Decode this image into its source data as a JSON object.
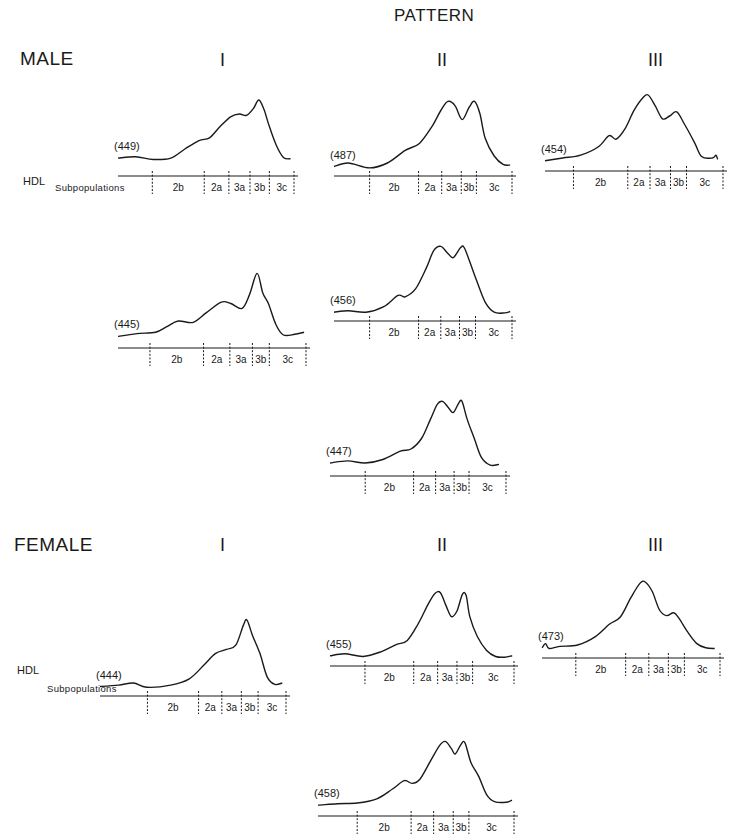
{
  "figure": {
    "header": "PATTERN",
    "groups": [
      {
        "id": "male",
        "label": "MALE"
      },
      {
        "id": "female",
        "label": "FEMALE"
      }
    ],
    "columns": [
      "I",
      "II",
      "III"
    ],
    "axis_label_line1": "HDL",
    "axis_label_line2": "Subpopulations",
    "subpopulation_labels": [
      "2b",
      "2a",
      "3a",
      "3b",
      "3c"
    ],
    "line_color": "#1a1a1a",
    "background": "#ffffff"
  },
  "chart_data": {
    "type": "line",
    "title": "PATTERN",
    "xlabel": "HDL Subpopulations",
    "x_regions": [
      "2b",
      "2a",
      "3a",
      "3b",
      "3c"
    ],
    "panels": [
      {
        "group": "MALE",
        "pattern": "I",
        "id": "(449)",
        "peaks": [
          "3b"
        ],
        "shoulder": [
          "3a"
        ]
      },
      {
        "group": "MALE",
        "pattern": "II",
        "id": "(487)",
        "peaks": [
          "3a",
          "3b"
        ]
      },
      {
        "group": "MALE",
        "pattern": "III",
        "id": "(454)",
        "peaks": [
          "2a"
        ],
        "shoulder": [
          "3b"
        ]
      },
      {
        "group": "MALE",
        "pattern": "I",
        "id": "(445)",
        "peaks": [
          "3b"
        ],
        "shoulder": [
          "3a",
          "2b"
        ]
      },
      {
        "group": "MALE",
        "pattern": "II",
        "id": "(456)",
        "peaks": [
          "3a",
          "3b"
        ]
      },
      {
        "group": "MALE",
        "pattern": "II",
        "id": "(447)",
        "peaks": [
          "3a",
          "3b"
        ]
      },
      {
        "group": "FEMALE",
        "pattern": "I",
        "id": "(444)",
        "peaks": [
          "3b"
        ],
        "shoulder": [
          "3a"
        ]
      },
      {
        "group": "FEMALE",
        "pattern": "II",
        "id": "(455)",
        "peaks": [
          "3a",
          "3b"
        ]
      },
      {
        "group": "FEMALE",
        "pattern": "III",
        "id": "(473)",
        "peaks": [
          "2a"
        ],
        "shoulder": [
          "3b"
        ]
      },
      {
        "group": "FEMALE",
        "pattern": "II",
        "id": "(458)",
        "peaks": [
          "3a",
          "3b"
        ],
        "shoulder": [
          "2a"
        ]
      }
    ]
  },
  "panels": [
    {
      "name": "male-I-449",
      "id_label": "(449)",
      "x": 118,
      "y": 90,
      "w": 176,
      "ticks": [
        0.0,
        0.195,
        0.49,
        0.63,
        0.75,
        0.86,
        1.0
      ],
      "curve": [
        [
          0,
          0.83
        ],
        [
          0.1,
          0.81
        ],
        [
          0.2,
          0.85
        ],
        [
          0.3,
          0.83
        ],
        [
          0.38,
          0.7
        ],
        [
          0.46,
          0.58
        ],
        [
          0.52,
          0.54
        ],
        [
          0.58,
          0.38
        ],
        [
          0.64,
          0.24
        ],
        [
          0.69,
          0.2
        ],
        [
          0.73,
          0.22
        ],
        [
          0.77,
          0.12
        ],
        [
          0.8,
          0.0
        ],
        [
          0.83,
          0.14
        ],
        [
          0.86,
          0.38
        ],
        [
          0.9,
          0.65
        ],
        [
          0.94,
          0.82
        ],
        [
          0.98,
          0.84
        ]
      ]
    },
    {
      "name": "male-II-487",
      "id_label": "(487)",
      "x": 334,
      "y": 90,
      "w": 178,
      "ticks": [
        0.0,
        0.2,
        0.475,
        0.605,
        0.715,
        0.8,
        1.0
      ],
      "curve": [
        [
          0,
          0.95
        ],
        [
          0.08,
          0.9
        ],
        [
          0.2,
          0.97
        ],
        [
          0.3,
          0.9
        ],
        [
          0.4,
          0.72
        ],
        [
          0.48,
          0.62
        ],
        [
          0.55,
          0.38
        ],
        [
          0.6,
          0.15
        ],
        [
          0.64,
          0.02
        ],
        [
          0.68,
          0.08
        ],
        [
          0.72,
          0.28
        ],
        [
          0.76,
          0.1
        ],
        [
          0.79,
          0.02
        ],
        [
          0.82,
          0.2
        ],
        [
          0.85,
          0.55
        ],
        [
          0.9,
          0.8
        ],
        [
          0.95,
          0.92
        ],
        [
          0.99,
          0.93
        ]
      ]
    },
    {
      "name": "male-III-454",
      "id_label": "(454)",
      "x": 545,
      "y": 85,
      "w": 178,
      "ticks": [
        0.0,
        0.16,
        0.465,
        0.59,
        0.705,
        0.795,
        1.0
      ],
      "curve": [
        [
          0,
          0.94
        ],
        [
          0.1,
          0.9
        ],
        [
          0.2,
          0.86
        ],
        [
          0.3,
          0.74
        ],
        [
          0.36,
          0.58
        ],
        [
          0.4,
          0.63
        ],
        [
          0.45,
          0.48
        ],
        [
          0.5,
          0.22
        ],
        [
          0.55,
          0.04
        ],
        [
          0.58,
          0.0
        ],
        [
          0.62,
          0.16
        ],
        [
          0.66,
          0.34
        ],
        [
          0.7,
          0.3
        ],
        [
          0.74,
          0.24
        ],
        [
          0.78,
          0.4
        ],
        [
          0.84,
          0.68
        ],
        [
          0.88,
          0.88
        ],
        [
          0.94,
          0.9
        ],
        [
          0.96,
          0.86
        ],
        [
          0.97,
          0.92
        ]
      ]
    },
    {
      "name": "male-I-445",
      "id_label": "(445)",
      "x": 118,
      "y": 262,
      "w": 188,
      "ticks": [
        0.0,
        0.17,
        0.455,
        0.595,
        0.715,
        0.805,
        1.0
      ],
      "curve": [
        [
          0,
          0.92
        ],
        [
          0.1,
          0.88
        ],
        [
          0.2,
          0.86
        ],
        [
          0.26,
          0.78
        ],
        [
          0.32,
          0.7
        ],
        [
          0.4,
          0.72
        ],
        [
          0.47,
          0.58
        ],
        [
          0.55,
          0.43
        ],
        [
          0.6,
          0.45
        ],
        [
          0.66,
          0.52
        ],
        [
          0.7,
          0.32
        ],
        [
          0.74,
          0.02
        ],
        [
          0.77,
          0.3
        ],
        [
          0.8,
          0.45
        ],
        [
          0.84,
          0.75
        ],
        [
          0.88,
          0.9
        ],
        [
          0.94,
          0.89
        ],
        [
          0.99,
          0.86
        ]
      ]
    },
    {
      "name": "male-II-456",
      "id_label": "(456)",
      "x": 334,
      "y": 235,
      "w": 178,
      "ticks": [
        0.0,
        0.2,
        0.475,
        0.6,
        0.705,
        0.795,
        1.0
      ],
      "curve": [
        [
          0,
          0.96
        ],
        [
          0.08,
          0.94
        ],
        [
          0.18,
          0.96
        ],
        [
          0.28,
          0.88
        ],
        [
          0.36,
          0.72
        ],
        [
          0.4,
          0.74
        ],
        [
          0.46,
          0.62
        ],
        [
          0.52,
          0.32
        ],
        [
          0.56,
          0.08
        ],
        [
          0.6,
          0.02
        ],
        [
          0.64,
          0.12
        ],
        [
          0.67,
          0.18
        ],
        [
          0.71,
          0.04
        ],
        [
          0.73,
          0.03
        ],
        [
          0.76,
          0.22
        ],
        [
          0.8,
          0.5
        ],
        [
          0.85,
          0.82
        ],
        [
          0.9,
          0.96
        ],
        [
          0.96,
          0.97
        ],
        [
          0.99,
          0.95
        ]
      ]
    },
    {
      "name": "male-II-447",
      "id_label": "(447)",
      "x": 330,
      "y": 390,
      "w": 176,
      "ticks": [
        0.0,
        0.2,
        0.475,
        0.6,
        0.705,
        0.79,
        1.0
      ],
      "curve": [
        [
          0,
          0.9
        ],
        [
          0.1,
          0.87
        ],
        [
          0.2,
          0.9
        ],
        [
          0.3,
          0.85
        ],
        [
          0.4,
          0.73
        ],
        [
          0.46,
          0.7
        ],
        [
          0.52,
          0.55
        ],
        [
          0.57,
          0.28
        ],
        [
          0.61,
          0.06
        ],
        [
          0.64,
          0.02
        ],
        [
          0.67,
          0.1
        ],
        [
          0.7,
          0.18
        ],
        [
          0.73,
          0.05
        ],
        [
          0.75,
          0.02
        ],
        [
          0.78,
          0.28
        ],
        [
          0.82,
          0.55
        ],
        [
          0.86,
          0.82
        ],
        [
          0.91,
          0.93
        ],
        [
          0.96,
          0.92
        ]
      ]
    },
    {
      "name": "female-I-444",
      "id_label": "(444)",
      "x": 100,
      "y": 610,
      "w": 186,
      "ticks": [
        0.0,
        0.255,
        0.53,
        0.655,
        0.76,
        0.85,
        1.0
      ],
      "curve": [
        [
          0,
          0.95
        ],
        [
          0.1,
          0.93
        ],
        [
          0.18,
          0.9
        ],
        [
          0.25,
          0.96
        ],
        [
          0.38,
          0.93
        ],
        [
          0.48,
          0.84
        ],
        [
          0.56,
          0.64
        ],
        [
          0.62,
          0.48
        ],
        [
          0.68,
          0.42
        ],
        [
          0.73,
          0.36
        ],
        [
          0.77,
          0.08
        ],
        [
          0.79,
          0.0
        ],
        [
          0.82,
          0.22
        ],
        [
          0.86,
          0.48
        ],
        [
          0.9,
          0.82
        ],
        [
          0.94,
          0.92
        ],
        [
          0.98,
          0.9
        ]
      ]
    },
    {
      "name": "female-II-455",
      "id_label": "(455)",
      "x": 330,
      "y": 580,
      "w": 184,
      "ticks": [
        0.0,
        0.19,
        0.455,
        0.585,
        0.69,
        0.775,
        1.0
      ],
      "curve": [
        [
          0,
          0.94
        ],
        [
          0.08,
          0.91
        ],
        [
          0.18,
          0.95
        ],
        [
          0.28,
          0.88
        ],
        [
          0.36,
          0.78
        ],
        [
          0.42,
          0.72
        ],
        [
          0.48,
          0.48
        ],
        [
          0.53,
          0.22
        ],
        [
          0.57,
          0.05
        ],
        [
          0.6,
          0.04
        ],
        [
          0.63,
          0.22
        ],
        [
          0.66,
          0.38
        ],
        [
          0.69,
          0.3
        ],
        [
          0.72,
          0.06
        ],
        [
          0.74,
          0.08
        ],
        [
          0.76,
          0.38
        ],
        [
          0.8,
          0.66
        ],
        [
          0.85,
          0.86
        ],
        [
          0.9,
          0.95
        ],
        [
          0.95,
          0.96
        ],
        [
          0.99,
          0.94
        ]
      ]
    },
    {
      "name": "female-III-473",
      "id_label": "(473)",
      "x": 542,
      "y": 572,
      "w": 178,
      "ticks": [
        0.0,
        0.19,
        0.47,
        0.6,
        0.71,
        0.8,
        1.0
      ],
      "curve": [
        [
          0,
          0.94
        ],
        [
          0.02,
          0.88
        ],
        [
          0.04,
          0.95
        ],
        [
          0.1,
          0.92
        ],
        [
          0.2,
          0.9
        ],
        [
          0.3,
          0.78
        ],
        [
          0.38,
          0.6
        ],
        [
          0.44,
          0.5
        ],
        [
          0.5,
          0.22
        ],
        [
          0.55,
          0.02
        ],
        [
          0.58,
          0.0
        ],
        [
          0.62,
          0.14
        ],
        [
          0.66,
          0.4
        ],
        [
          0.7,
          0.48
        ],
        [
          0.74,
          0.44
        ],
        [
          0.77,
          0.52
        ],
        [
          0.82,
          0.72
        ],
        [
          0.87,
          0.88
        ],
        [
          0.92,
          0.94
        ],
        [
          0.97,
          0.95
        ]
      ]
    },
    {
      "name": "female-II-458",
      "id_label": "(458)",
      "x": 318,
      "y": 730,
      "w": 196,
      "ticks": [
        0.0,
        0.2,
        0.475,
        0.59,
        0.69,
        0.77,
        1.0
      ],
      "curve": [
        [
          0,
          0.93
        ],
        [
          0.1,
          0.91
        ],
        [
          0.2,
          0.9
        ],
        [
          0.3,
          0.84
        ],
        [
          0.38,
          0.7
        ],
        [
          0.44,
          0.58
        ],
        [
          0.48,
          0.62
        ],
        [
          0.52,
          0.56
        ],
        [
          0.57,
          0.32
        ],
        [
          0.62,
          0.08
        ],
        [
          0.65,
          0.02
        ],
        [
          0.68,
          0.12
        ],
        [
          0.7,
          0.2
        ],
        [
          0.73,
          0.06
        ],
        [
          0.75,
          0.04
        ],
        [
          0.78,
          0.32
        ],
        [
          0.82,
          0.52
        ],
        [
          0.86,
          0.78
        ],
        [
          0.9,
          0.88
        ],
        [
          0.96,
          0.89
        ],
        [
          0.99,
          0.86
        ]
      ]
    }
  ]
}
